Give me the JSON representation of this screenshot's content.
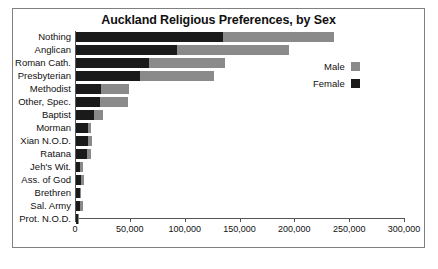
{
  "chart_data": {
    "type": "bar",
    "orientation": "horizontal",
    "stacked": true,
    "title": "Auckland Religious Preferences, by Sex",
    "xlabel": "",
    "ylabel": "",
    "xlim": [
      0,
      300000
    ],
    "grid": false,
    "legend_position": "right",
    "categories": [
      "Nothing",
      "Anglican",
      "Roman Cath.",
      "Presbyterian",
      "Methodist",
      "Other, Spec.",
      "Baptist",
      "Morman",
      "Xian N.O.D.",
      "Ratana",
      "Jeh's Wit.",
      "Ass. of God",
      "Brethren",
      "Sal. Army",
      "Prot. N.O.D."
    ],
    "series": [
      {
        "name": "Female",
        "color": "#1a1a1a",
        "values": [
          134000,
          92000,
          67000,
          58000,
          23000,
          22000,
          16000,
          11000,
          11000,
          10000,
          4000,
          5000,
          4000,
          4000,
          2000
        ]
      },
      {
        "name": "Male",
        "color": "#8a8a8a",
        "values": [
          101000,
          102000,
          69000,
          68000,
          25000,
          25000,
          9000,
          3000,
          4000,
          4000,
          2000,
          2000,
          1000,
          2000,
          1000
        ]
      }
    ],
    "totals": [
      235000,
      194000,
      136000,
      126000,
      48000,
      47000,
      25000,
      14000,
      15000,
      14000,
      6000,
      7000,
      5000,
      6000,
      3000
    ],
    "ticks": [
      {
        "value": 0,
        "label": "0"
      },
      {
        "value": 50000,
        "label": "50,000"
      },
      {
        "value": 100000,
        "label": "100,000"
      },
      {
        "value": 150000,
        "label": "150,000"
      },
      {
        "value": 200000,
        "label": "200,000"
      },
      {
        "value": 250000,
        "label": "250,000"
      },
      {
        "value": 300000,
        "label": "300,000"
      }
    ],
    "legend": [
      {
        "label": "Male",
        "color": "#8a8a8a"
      },
      {
        "label": "Female",
        "color": "#1a1a1a"
      }
    ]
  }
}
